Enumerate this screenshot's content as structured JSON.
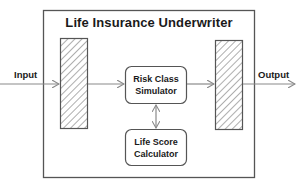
{
  "diagram": {
    "title": "Life Insurance Underwriter",
    "input_label": "Input",
    "output_label": "Output",
    "boxes": [
      {
        "id": "risk-class-simulator",
        "line1": "Risk Class",
        "line2": "Simulator"
      },
      {
        "id": "life-score-calculator",
        "line1": "Life Score",
        "line2": "Calculator"
      }
    ],
    "colors": {
      "stroke": "#555555",
      "arrow": "#8a8a8a",
      "hatch": "#777777",
      "text": "#1a1a1a"
    }
  }
}
